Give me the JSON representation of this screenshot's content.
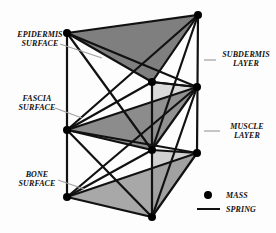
{
  "labels": {
    "epidermis": [
      "EPIDERMIS",
      "SURFACE"
    ],
    "subdermis": [
      "SUBDERMIS",
      "LAYER"
    ],
    "fascia": [
      "FASCIA",
      "SURFACE"
    ],
    "muscle": [
      "MUSCLE",
      "LAYER"
    ],
    "bone": [
      "BONE",
      "SURFACE"
    ]
  },
  "legend": {
    "mass": "MASS",
    "spring": "SPRING"
  },
  "colors": {
    "line": "#111111",
    "surface_top": "#7d7d7d",
    "surface_mid": "#8a8a8a",
    "surface_bottom": "#a6a6a6",
    "leader": "#a0a0a0"
  },
  "nodes": {
    "top": [
      [
        67,
        33
      ],
      [
        152,
        82
      ],
      [
        198,
        15
      ]
    ],
    "mid": [
      [
        67,
        130
      ],
      [
        152,
        150
      ],
      [
        197,
        87
      ]
    ],
    "bot": [
      [
        67,
        197
      ],
      [
        152,
        217
      ],
      [
        197,
        153
      ]
    ]
  }
}
